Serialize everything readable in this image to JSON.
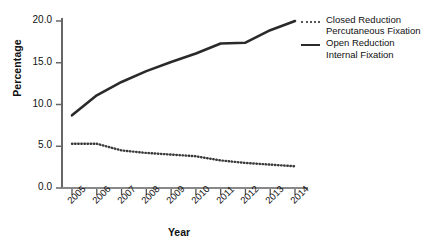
{
  "chart_data": {
    "type": "line",
    "title": "",
    "xlabel": "Year",
    "ylabel": "Percentage",
    "categories": [
      "2005",
      "2006",
      "2007",
      "2008",
      "2009",
      "2010",
      "2011",
      "2012",
      "2013",
      "2014"
    ],
    "x": [
      2005,
      2006,
      2007,
      2008,
      2009,
      2010,
      2011,
      2012,
      2013,
      2014
    ],
    "xlim": [
      2005,
      2014
    ],
    "ylim": [
      0.0,
      20.0
    ],
    "yticks": [
      0.0,
      5.0,
      10.0,
      15.0,
      20.0
    ],
    "ytick_labels": [
      "0.0",
      "5.0",
      "10.0",
      "15.0",
      "20.0"
    ],
    "grid": false,
    "legend_position": "upper right outside",
    "series": [
      {
        "name": "Closed Reduction Percutaneous Fixation",
        "style": "dotted",
        "color": "#555555",
        "values": [
          5.3,
          5.3,
          4.5,
          4.2,
          4.0,
          3.8,
          3.3,
          3.0,
          2.8,
          2.6
        ]
      },
      {
        "name": "Open Reduction Internal Fixation",
        "style": "solid",
        "color": "#2a2a2a",
        "values": [
          8.7,
          11.1,
          12.7,
          14.0,
          15.1,
          16.1,
          17.3,
          17.4,
          18.9,
          20.0
        ]
      }
    ]
  },
  "legend": {
    "items": [
      {
        "key": "dotted-line-key",
        "line1": "Closed Reduction",
        "line2": "Percutaneous Fixation"
      },
      {
        "key": "solid-line-key",
        "line1": "Open Reduction",
        "line2": "Internal Fixation"
      }
    ]
  },
  "axes": {
    "y_title": "Percentage",
    "x_title": "Year"
  }
}
